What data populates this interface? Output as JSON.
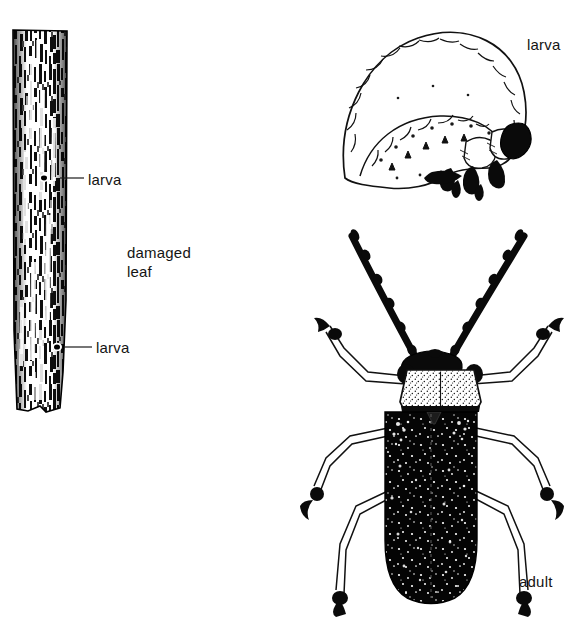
{
  "figure": {
    "type": "scientific-line-illustration",
    "background_color": "#ffffff",
    "ink_color": "#000000",
    "text_color": "#141414"
  },
  "labels": {
    "larva_leaf_top": "larva",
    "larva_leaf_bottom": "larva",
    "damaged_leaf_line1": "damaged",
    "damaged_leaf_line2": "leaf",
    "larva_grub": "larva",
    "adult": "adult"
  },
  "panels": {
    "damaged_leaf": {
      "name": "damaged-leaf-panel",
      "description": "Vertical narrow leaf blade with heavy stippled feeding damage",
      "bounds": {
        "x": 12,
        "y": 30,
        "width": 56,
        "height": 384
      },
      "callouts": [
        {
          "label": "larva",
          "leader_from_x": 60,
          "leader_to_x": 84,
          "y": 178
        },
        {
          "label": "larva",
          "leader_from_x": 64,
          "leader_to_x": 92,
          "y": 347
        }
      ]
    },
    "larva": {
      "name": "larva-panel",
      "description": "C-shaped grub in lateral view, segmented body, dark head capsule and thoracic legs at right",
      "bounds": {
        "x": 336,
        "y": 28,
        "width": 196,
        "height": 162
      }
    },
    "adult": {
      "name": "adult-beetle-panel",
      "description": "Dorsal view beetle with long dark antennae, pale stippled pronotum, dark punctate elytra and six legs",
      "bounds": {
        "x": 310,
        "y": 222,
        "width": 230,
        "height": 392
      },
      "parts": {
        "antenna_left_tip": {
          "x": 348,
          "y": 228
        },
        "antenna_right_tip": {
          "x": 528,
          "y": 228
        },
        "pronotum": {
          "x": 405,
          "y": 365,
          "width": 76,
          "height": 42
        },
        "elytra": {
          "x": 385,
          "y": 410,
          "width": 92,
          "height": 192
        }
      }
    }
  }
}
